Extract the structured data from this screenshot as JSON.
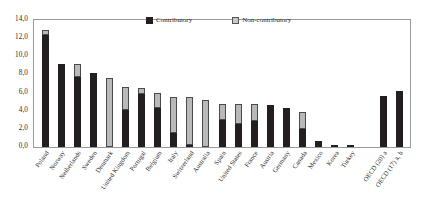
{
  "chart_data": {
    "type": "bar",
    "stacked": true,
    "title": "",
    "subtitle": "",
    "xlabel": "",
    "ylabel": "",
    "ylim": [
      0.0,
      14.0
    ],
    "ytick_labels": [
      "0,0",
      "2,0",
      "4,0",
      "6,0",
      "8,0",
      "10,0",
      "12,0",
      "14,0"
    ],
    "ytick_values": [
      0.0,
      2.0,
      4.0,
      6.0,
      8.0,
      10.0,
      12.0,
      14.0
    ],
    "grid": false,
    "legend_position": "top-center",
    "decimal_separator": ",",
    "categories": [
      "Poland",
      "Norway",
      "Netherlands",
      "Sweden",
      "Denmark",
      "United Kingdom",
      "Portugal",
      "Belgium",
      "Italy",
      "Switzerland",
      "Australia",
      "Spain",
      "United States",
      "France",
      "Austria",
      "Germany",
      "Canada",
      "Mexico",
      "Korea",
      "Turkey",
      "OECD (20) a",
      "OECD (17) a, b"
    ],
    "separator_before_index": 20,
    "series": [
      {
        "name": "Contributory",
        "color": "#231f20",
        "values": [
          12.3,
          9.2,
          7.7,
          8.2,
          0.0,
          4.1,
          5.8,
          4.35,
          1.6,
          0.15,
          0.0,
          3.0,
          2.5,
          2.9,
          4.6,
          4.3,
          2.0,
          0.7,
          0.25,
          0.2,
          5.6,
          6.2
        ]
      },
      {
        "name": "Non-contributory",
        "color": "#b9b9b9",
        "values": [
          0.55,
          0.0,
          1.4,
          0.0,
          7.65,
          2.5,
          0.7,
          1.65,
          3.9,
          5.25,
          5.15,
          1.7,
          2.2,
          1.8,
          0.0,
          0.0,
          1.9,
          0.0,
          0.0,
          0.0,
          0.0,
          0.0
        ]
      }
    ],
    "totals": [
      12.85,
      9.2,
      9.1,
      8.2,
      7.65,
      6.6,
      6.5,
      6.0,
      5.5,
      5.4,
      5.15,
      4.7,
      4.7,
      4.7,
      4.6,
      4.3,
      3.9,
      0.7,
      0.25,
      0.2,
      5.6,
      6.2
    ]
  },
  "legend": {
    "items": [
      {
        "label": "Contributory",
        "swatch": "black-square-icon"
      },
      {
        "label": "Non-contributory",
        "swatch": "gray-square-icon"
      }
    ]
  }
}
